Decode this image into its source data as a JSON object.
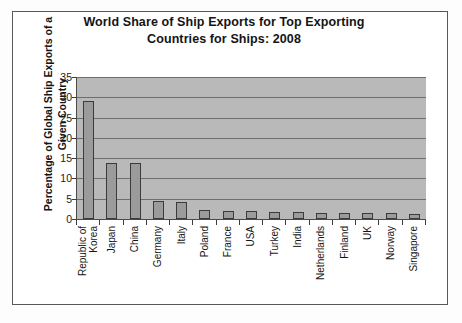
{
  "chart_data": {
    "type": "bar",
    "title": "World Share of Ship Exports for Top Exporting Countries for Ships: 2008",
    "title_lines": [
      "World Share of Ship Exports for Top Exporting",
      "Countries for Ships: 2008"
    ],
    "xlabel": "",
    "ylabel": "Percentage of Global Ship Exports of a Given Country",
    "ylabel_lines": [
      "Percentage of Global Ship Exports of a",
      "Given Country"
    ],
    "ylim": [
      0,
      35
    ],
    "ytick_values": [
      0,
      5,
      10,
      15,
      20,
      25,
      30,
      35
    ],
    "ytick_labels": [
      "0",
      "5",
      "10",
      "15",
      "20",
      "25",
      "30",
      "35"
    ],
    "grid": true,
    "grid_axis": "y",
    "legend": false,
    "categories": [
      "Republic of Korea",
      "Japan",
      "China",
      "Germany",
      "Italy",
      "Poland",
      "France",
      "USA",
      "Turkey",
      "India",
      "Netherlands",
      "Finland",
      "UK",
      "Norway",
      "Singapore"
    ],
    "category_label_lines": [
      [
        "Republic of",
        "Korea"
      ],
      [
        "Japan"
      ],
      [
        "China"
      ],
      [
        "Germany"
      ],
      [
        "Italy"
      ],
      [
        "Poland"
      ],
      [
        "France"
      ],
      [
        "USA"
      ],
      [
        "Turkey"
      ],
      [
        "India"
      ],
      [
        "Netherlands"
      ],
      [
        "Finland"
      ],
      [
        "UK"
      ],
      [
        "Norway"
      ],
      [
        "Singapore"
      ]
    ],
    "values": [
      29.0,
      13.8,
      13.8,
      4.5,
      4.2,
      2.3,
      2.0,
      1.9,
      1.8,
      1.7,
      1.6,
      1.5,
      1.5,
      1.4,
      1.3
    ],
    "colors": {
      "bar_fill": "#9b9b9b",
      "bar_edge": "#3b3b3b",
      "plot_background": "#b9b9b9",
      "gridline": "#6e6e6e",
      "axis": "#4a4a4a",
      "frame": "#585858",
      "text": "#141414",
      "page_background": "#ffffff"
    }
  }
}
